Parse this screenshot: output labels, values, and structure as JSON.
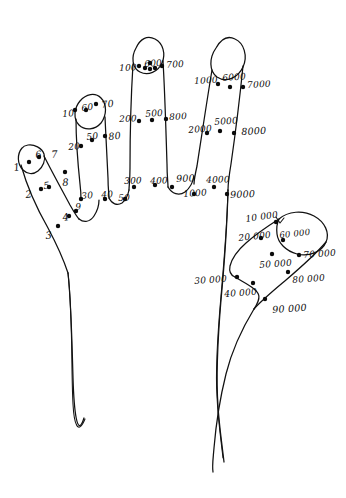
{
  "figure": {
    "ink_color": "#111111",
    "background_color": "#ffffff",
    "dot_color": "#0b0b0b"
  },
  "labels": [
    {
      "id": "l-1",
      "text": "1",
      "x": 13,
      "y": 163,
      "size": "s1",
      "rot": -8
    },
    {
      "id": "l-6a",
      "text": "6",
      "x": 35,
      "y": 150,
      "size": "s2",
      "rot": -6
    },
    {
      "id": "l-7",
      "text": "7",
      "x": 51,
      "y": 150,
      "size": "s1",
      "rot": -4
    },
    {
      "id": "l-2",
      "text": "2",
      "x": 25,
      "y": 190,
      "size": "s1",
      "rot": -6
    },
    {
      "id": "l-5",
      "text": "5",
      "x": 43,
      "y": 181,
      "size": "s2",
      "rot": -6
    },
    {
      "id": "l-8",
      "text": "8",
      "x": 62,
      "y": 178,
      "size": "s1",
      "rot": -4
    },
    {
      "id": "l-3",
      "text": "3",
      "x": 45,
      "y": 231,
      "size": "s1",
      "rot": -5
    },
    {
      "id": "l-4",
      "text": "4",
      "x": 62,
      "y": 213,
      "size": "s1",
      "rot": -8
    },
    {
      "id": "l-9",
      "text": "9",
      "x": 75,
      "y": 203,
      "size": "s3",
      "rot": -6
    },
    {
      "id": "l-10",
      "text": "10",
      "x": 62,
      "y": 110,
      "size": "s3",
      "rot": -4
    },
    {
      "id": "l-60",
      "text": "60",
      "x": 81,
      "y": 104,
      "size": "s3",
      "rot": -6
    },
    {
      "id": "l-70",
      "text": "70",
      "x": 101,
      "y": 100,
      "size": "s2",
      "rot": -6
    },
    {
      "id": "l-20",
      "text": "20",
      "x": 68,
      "y": 143,
      "size": "s3",
      "rot": -4
    },
    {
      "id": "l-50",
      "text": "50",
      "x": 86,
      "y": 133,
      "size": "s3",
      "rot": -6
    },
    {
      "id": "l-80",
      "text": "80",
      "x": 108,
      "y": 132,
      "size": "s2",
      "rot": -6
    },
    {
      "id": "l-30",
      "text": "30",
      "x": 81,
      "y": 192,
      "size": "s3",
      "rot": -4
    },
    {
      "id": "l-40",
      "text": "40",
      "x": 101,
      "y": 191,
      "size": "s3",
      "rot": -4
    },
    {
      "id": "l-100",
      "text": "100",
      "x": 119,
      "y": 64,
      "size": "s3",
      "rot": -2
    },
    {
      "id": "l-600",
      "text": "600",
      "x": 144,
      "y": 60,
      "size": "s3",
      "rot": -4
    },
    {
      "id": "l-700",
      "text": "700",
      "x": 166,
      "y": 61,
      "size": "s3",
      "rot": -4
    },
    {
      "id": "l-200",
      "text": "200",
      "x": 119,
      "y": 115,
      "size": "s3",
      "rot": -2
    },
    {
      "id": "l-500",
      "text": "500",
      "x": 145,
      "y": 110,
      "size": "s3",
      "rot": -4
    },
    {
      "id": "l-800",
      "text": "800",
      "x": 169,
      "y": 113,
      "size": "s3",
      "rot": -3
    },
    {
      "id": "l-300",
      "text": "300",
      "x": 124,
      "y": 177,
      "size": "s3",
      "rot": -2
    },
    {
      "id": "l-50b",
      "text": "50",
      "x": 118,
      "y": 194,
      "size": "s3",
      "rot": -2
    },
    {
      "id": "l-400",
      "text": "400",
      "x": 150,
      "y": 177,
      "size": "s3",
      "rot": -2
    },
    {
      "id": "l-900",
      "text": "900",
      "x": 176,
      "y": 174,
      "size": "s2",
      "rot": -2
    },
    {
      "id": "l-1000b",
      "text": "1000",
      "x": 183,
      "y": 190,
      "size": "s3",
      "rot": -4
    },
    {
      "id": "l-1000",
      "text": "1000",
      "x": 194,
      "y": 77,
      "size": "s3",
      "rot": -3
    },
    {
      "id": "l-6000",
      "text": "6000",
      "x": 222,
      "y": 74,
      "size": "s3",
      "rot": -4
    },
    {
      "id": "l-7000",
      "text": "7000",
      "x": 247,
      "y": 81,
      "size": "s3",
      "rot": -3
    },
    {
      "id": "l-2000",
      "text": "2000",
      "x": 188,
      "y": 126,
      "size": "s3",
      "rot": -4
    },
    {
      "id": "l-5000",
      "text": "5000",
      "x": 214,
      "y": 118,
      "size": "s3",
      "rot": -4
    },
    {
      "id": "l-8000",
      "text": "8000",
      "x": 241,
      "y": 127,
      "size": "s2",
      "rot": -3
    },
    {
      "id": "l-4000",
      "text": "4000",
      "x": 206,
      "y": 176,
      "size": "s3",
      "rot": -2
    },
    {
      "id": "l-9000",
      "text": "9000",
      "x": 230,
      "y": 190,
      "size": "s2",
      "rot": -2
    },
    {
      "id": "l-10000",
      "text": "10 000",
      "x": 245,
      "y": 215,
      "size": "s3",
      "rot": -8
    },
    {
      "id": "l-20000",
      "text": "20 000",
      "x": 238,
      "y": 234,
      "size": "s3",
      "rot": -6
    },
    {
      "id": "l-60000",
      "text": "60 000",
      "x": 279,
      "y": 231,
      "size": "s4",
      "rot": -6
    },
    {
      "id": "l-70000",
      "text": "70 000",
      "x": 303,
      "y": 251,
      "size": "s3",
      "rot": -4
    },
    {
      "id": "l-50000",
      "text": "50 000",
      "x": 259,
      "y": 261,
      "size": "s3",
      "rot": -4
    },
    {
      "id": "l-80000",
      "text": "80 000",
      "x": 292,
      "y": 276,
      "size": "s3",
      "rot": -4
    },
    {
      "id": "l-30000",
      "text": "30 000",
      "x": 194,
      "y": 277,
      "size": "s3",
      "rot": -4
    },
    {
      "id": "l-40000",
      "text": "40 000",
      "x": 224,
      "y": 290,
      "size": "s3",
      "rot": -4
    },
    {
      "id": "l-90000",
      "text": "90 000",
      "x": 272,
      "y": 305,
      "size": "s2",
      "rot": -4
    }
  ],
  "dots": [
    {
      "id": "d-1",
      "cx": 29,
      "cy": 162,
      "r": 2.2
    },
    {
      "id": "d-6a",
      "cx": 39,
      "cy": 157,
      "r": 2.2
    },
    {
      "id": "d-2",
      "cx": 41,
      "cy": 189,
      "r": 2.2
    },
    {
      "id": "d-5",
      "cx": 49,
      "cy": 187,
      "r": 2.2
    },
    {
      "id": "d-8",
      "cx": 65,
      "cy": 172,
      "r": 2.2
    },
    {
      "id": "d-3",
      "cx": 58,
      "cy": 226,
      "r": 2.2
    },
    {
      "id": "d-4",
      "cx": 69,
      "cy": 216,
      "r": 2.2
    },
    {
      "id": "d-9",
      "cx": 76,
      "cy": 211,
      "r": 2.2
    },
    {
      "id": "d-10",
      "cx": 75,
      "cy": 110,
      "r": 2.2
    },
    {
      "id": "d-60",
      "cx": 86,
      "cy": 110,
      "r": 2.2
    },
    {
      "id": "d-70",
      "cx": 96,
      "cy": 104,
      "r": 2.2
    },
    {
      "id": "d-20",
      "cx": 81,
      "cy": 146,
      "r": 2.2
    },
    {
      "id": "d-50",
      "cx": 92,
      "cy": 140,
      "r": 2.2
    },
    {
      "id": "d-80",
      "cx": 105,
      "cy": 136,
      "r": 2.2
    },
    {
      "id": "d-30",
      "cx": 81,
      "cy": 199,
      "r": 2.2
    },
    {
      "id": "d-40",
      "cx": 105,
      "cy": 199,
      "r": 2.2
    },
    {
      "id": "d-100",
      "cx": 139,
      "cy": 66,
      "r": 2.2
    },
    {
      "id": "d-600a",
      "cx": 145,
      "cy": 68,
      "r": 2.2
    },
    {
      "id": "d-600b",
      "cx": 150,
      "cy": 69,
      "r": 2.2
    },
    {
      "id": "d-600c",
      "cx": 155,
      "cy": 68,
      "r": 2.2
    },
    {
      "id": "d-600d",
      "cx": 150,
      "cy": 63,
      "r": 2.2
    },
    {
      "id": "d-700",
      "cx": 162,
      "cy": 66,
      "r": 2.2
    },
    {
      "id": "d-200",
      "cx": 139,
      "cy": 121,
      "r": 2.2
    },
    {
      "id": "d-500",
      "cx": 152,
      "cy": 120,
      "r": 2.2
    },
    {
      "id": "d-800",
      "cx": 166,
      "cy": 119,
      "r": 2.2
    },
    {
      "id": "d-300",
      "cx": 134,
      "cy": 187,
      "r": 2.2
    },
    {
      "id": "d-50b",
      "cx": 125,
      "cy": 199,
      "r": 2.2
    },
    {
      "id": "d-400",
      "cx": 155,
      "cy": 185,
      "r": 2.2
    },
    {
      "id": "d-900",
      "cx": 172,
      "cy": 187,
      "r": 2.2
    },
    {
      "id": "d-1000b",
      "cx": 194,
      "cy": 194,
      "r": 2.2
    },
    {
      "id": "d-1000",
      "cx": 218,
      "cy": 84,
      "r": 2.2
    },
    {
      "id": "d-6000",
      "cx": 230,
      "cy": 87,
      "r": 2.2
    },
    {
      "id": "d-7000",
      "cx": 243,
      "cy": 87,
      "r": 2.2
    },
    {
      "id": "d-2000",
      "cx": 207,
      "cy": 133,
      "r": 2.2
    },
    {
      "id": "d-5000",
      "cx": 220,
      "cy": 131,
      "r": 2.2
    },
    {
      "id": "d-8000",
      "cx": 234,
      "cy": 133,
      "r": 2.2
    },
    {
      "id": "d-4000",
      "cx": 214,
      "cy": 187,
      "r": 2.2
    },
    {
      "id": "d-9000",
      "cx": 227,
      "cy": 194,
      "r": 2.2
    },
    {
      "id": "d-10000",
      "cx": 276,
      "cy": 222,
      "r": 2.2
    },
    {
      "id": "d-20000",
      "cx": 261,
      "cy": 238,
      "r": 2.2
    },
    {
      "id": "d-60000",
      "cx": 283,
      "cy": 240,
      "r": 2.2
    },
    {
      "id": "d-70000",
      "cx": 299,
      "cy": 255,
      "r": 2.2
    },
    {
      "id": "d-50000",
      "cx": 272,
      "cy": 254,
      "r": 2.2
    },
    {
      "id": "d-80000",
      "cx": 288,
      "cy": 272,
      "r": 2.2
    },
    {
      "id": "d-30000",
      "cx": 237,
      "cy": 277,
      "r": 2.2
    },
    {
      "id": "d-40000",
      "cx": 253,
      "cy": 283,
      "r": 2.2
    },
    {
      "id": "d-90000",
      "cx": 265,
      "cy": 299,
      "r": 2.2
    }
  ]
}
